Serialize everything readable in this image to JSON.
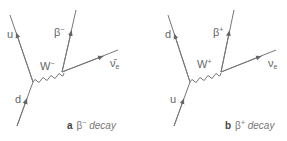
{
  "diagrams": [
    {
      "id": "a",
      "caption_letter": "a",
      "caption_symbol": "β",
      "caption_charge": "−",
      "caption_text": " decay",
      "incoming_quark": "d",
      "outgoing_quark": "u",
      "boson": "W",
      "boson_charge": "−",
      "lepton": "β",
      "lepton_charge": "−",
      "neutrino": "ν̄",
      "neutrino_sub": "e"
    },
    {
      "id": "b",
      "caption_letter": "b",
      "caption_symbol": "β",
      "caption_charge": "+",
      "caption_text": " decay",
      "incoming_quark": "u",
      "outgoing_quark": "d",
      "boson": "W",
      "boson_charge": "+",
      "lepton": "β",
      "lepton_charge": "+",
      "neutrino": "ν",
      "neutrino_sub": "e"
    }
  ],
  "colors": {
    "line": "#777777",
    "text": "#666666"
  }
}
